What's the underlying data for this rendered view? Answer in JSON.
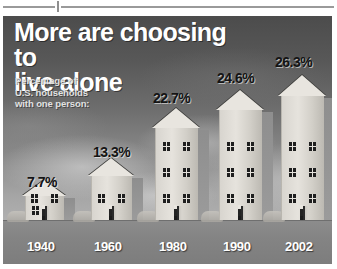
{
  "headline": {
    "line1": "More are choosing to",
    "line2": "live alone"
  },
  "subtitle": {
    "line1": "Percentage of",
    "line2": "U.S. households",
    "line3": "with one person:"
  },
  "chart_data": {
    "type": "bar",
    "title": "More are choosing to live alone",
    "subtitle": "Percentage of U.S. households with one person:",
    "categories": [
      "1940",
      "1960",
      "1980",
      "1990",
      "2002"
    ],
    "values": [
      7.7,
      13.3,
      22.7,
      24.6,
      26.3
    ],
    "value_labels": [
      "7.7%",
      "13.3%",
      "22.7%",
      "24.6%",
      "26.3%"
    ],
    "xlabel": "",
    "ylabel": "Percentage of U.S. households with one person",
    "ylim": [
      0,
      28
    ],
    "grid": false,
    "legend": false,
    "note": "Bars are drawn as houses whose height scales with the percentage"
  },
  "colors": {
    "headline_text": "#ffffff",
    "subtitle_text": "#e2e2e2",
    "value_label_text": "#141414",
    "year_label_text": "#ffffff",
    "house_fill": "#e6e3dd",
    "ground": "#848484",
    "sky_top": "#4c4c4c",
    "sky_bottom": "#b0b0b0"
  }
}
